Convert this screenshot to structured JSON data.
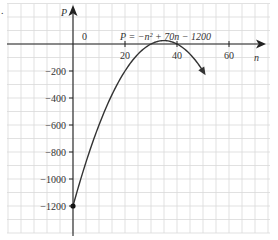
{
  "chart_data": {
    "type": "line",
    "title": "",
    "equation": "P = −n² + 70n − 1200",
    "xlabel": "n",
    "ylabel": "P",
    "origin_label": "0",
    "xlim": [
      -25,
      75
    ],
    "ylim": [
      -1400,
      150
    ],
    "x_ticks": [
      20,
      40,
      60
    ],
    "x_tick_labels": [
      "20",
      "40",
      "60"
    ],
    "y_ticks": [
      -200,
      -400,
      -600,
      -800,
      -1000,
      -1200
    ],
    "y_tick_labels": [
      "−200",
      "−400",
      "−600",
      "−800",
      "−1000",
      "−1200"
    ],
    "grid": true,
    "grid_step_x": 5,
    "grid_step_y": 100,
    "series": [
      {
        "name": "P = −n² + 70n − 1200",
        "function": "-n^2 + 70n - 1200",
        "n_start": 0,
        "n_end": 51,
        "x": [
          0,
          5,
          10,
          15,
          20,
          25,
          30,
          35,
          40,
          45,
          50
        ],
        "values": [
          -1200,
          -875,
          -600,
          -375,
          -200,
          -75,
          0,
          25,
          0,
          -75,
          -200
        ],
        "start_point": {
          "n": 0,
          "P": -1200,
          "marker": "dot"
        },
        "end_arrow": true
      }
    ],
    "colors": {
      "curve": "#333333",
      "grid": "#d9d9d9",
      "axis": "#222222"
    }
  },
  "left_mark": "."
}
